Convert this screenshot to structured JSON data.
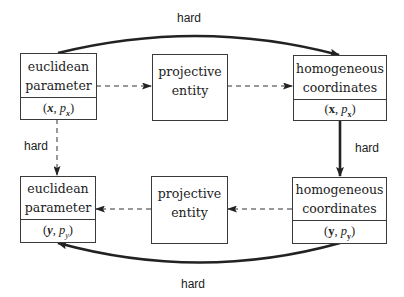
{
  "diagram": {
    "boxes": [
      {
        "id": "euclidean-x",
        "line1": "euclidean",
        "line2": "parameter",
        "math_open": "(",
        "math_var": "x",
        "math_sep": ", ",
        "math_p": "p",
        "math_sub": "x",
        "math_close": ")",
        "var_style": "bold-italic"
      },
      {
        "id": "projective-top",
        "line1": "projective",
        "line2": "entity"
      },
      {
        "id": "homogeneous-x",
        "line1": "homogeneous",
        "line2": "coordinates",
        "math_open": "(",
        "math_var": "x",
        "math_sep": ", ",
        "math_p": "p",
        "math_sub": "x",
        "math_close": ")",
        "var_style": "bold-upright"
      },
      {
        "id": "euclidean-y",
        "line1": "euclidean",
        "line2": "parameter",
        "math_open": "(",
        "math_var": "y",
        "math_sep": ", ",
        "math_p": "p",
        "math_sub": "y",
        "math_close": ")",
        "var_style": "bold-italic"
      },
      {
        "id": "projective-bottom",
        "line1": "projective",
        "line2": "entity"
      },
      {
        "id": "homogeneous-y",
        "line1": "homogeneous",
        "line2": "coordinates",
        "math_open": "(",
        "math_var": "y",
        "math_sep": ", ",
        "math_p": "p",
        "math_sub": "y",
        "math_close": ")",
        "var_style": "bold-upright"
      }
    ],
    "edges": [
      {
        "from": "euclidean-x",
        "to": "homogeneous-x",
        "style": "thick-solid-curved",
        "label": "hard"
      },
      {
        "from": "euclidean-x",
        "to": "projective-top",
        "style": "dashed"
      },
      {
        "from": "projective-top",
        "to": "homogeneous-x",
        "style": "dashed"
      },
      {
        "from": "euclidean-x",
        "to": "euclidean-y",
        "style": "dashed",
        "label": "hard"
      },
      {
        "from": "homogeneous-x",
        "to": "homogeneous-y",
        "style": "thick-solid",
        "label": "hard"
      },
      {
        "from": "homogeneous-y",
        "to": "projective-bottom",
        "style": "dashed"
      },
      {
        "from": "projective-bottom",
        "to": "euclidean-y",
        "style": "dashed"
      },
      {
        "from": "homogeneous-y",
        "to": "euclidean-y",
        "style": "thick-solid-curved",
        "label": "hard"
      }
    ],
    "labels": {
      "top": "hard",
      "left": "hard",
      "right": "hard",
      "bottom": "hard"
    },
    "colors": {
      "line": "#222222",
      "border": "#3a3a3a",
      "background": "#ffffff"
    }
  }
}
